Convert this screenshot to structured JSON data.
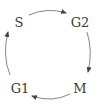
{
  "diagram": {
    "type": "cycle",
    "phases": [
      {
        "id": "s",
        "label": "S",
        "x": 19,
        "y": 22
      },
      {
        "id": "g2",
        "label": "G2",
        "x": 80,
        "y": 22
      },
      {
        "id": "m",
        "label": "M",
        "x": 80,
        "y": 88
      },
      {
        "id": "g1",
        "label": "G1",
        "x": 20,
        "y": 88
      }
    ],
    "edges": [
      {
        "from": "S",
        "to": "G2",
        "direction": "clockwise"
      },
      {
        "from": "G2",
        "to": "M",
        "direction": "clockwise"
      },
      {
        "from": "M",
        "to": "G1",
        "direction": "clockwise"
      },
      {
        "from": "G1",
        "to": "S",
        "direction": "clockwise"
      }
    ],
    "colors": {
      "text": "#3a3a3a",
      "arrow": "#555555",
      "background": "#ffffff"
    }
  }
}
